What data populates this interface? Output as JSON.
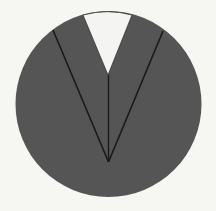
{
  "diagram": {
    "type": "circle-with-v-notch",
    "canvas": {
      "width": 216,
      "height": 211
    },
    "background": "#f6f6f3",
    "circle": {
      "cx": 108.5,
      "cy": 104,
      "r": 93,
      "fill": "#555555"
    },
    "notch": {
      "fill": "#f4f4f2",
      "top_left": [
        83,
        15
      ],
      "top_right": [
        132,
        15
      ],
      "bottom": [
        108,
        75
      ]
    },
    "lines": [
      {
        "name": "left-line",
        "from": [
          53,
          30
        ],
        "to": [
          108.5,
          162
        ]
      },
      {
        "name": "right-line",
        "from": [
          163,
          31
        ],
        "to": [
          108.5,
          162
        ]
      },
      {
        "name": "center-line",
        "from": [
          108.5,
          75
        ],
        "to": [
          108.5,
          162
        ]
      }
    ],
    "apex": [
      108.5,
      162
    ],
    "stroke": "#1a1a1a"
  }
}
